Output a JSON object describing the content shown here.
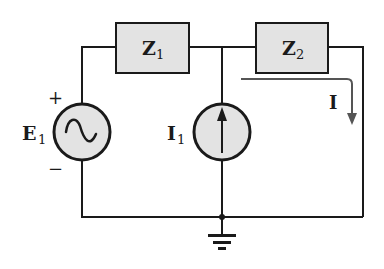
{
  "diagram": {
    "type": "ac circuit schematic",
    "colors": {
      "wire": "#1a1a1a",
      "component_fill": "#e3e3e3",
      "arrow": "#555555",
      "background": "#ffffff"
    },
    "components": {
      "z1": {
        "label": "Z",
        "subscript": "1"
      },
      "z2": {
        "label": "Z",
        "subscript": "2"
      },
      "e1": {
        "label": "E",
        "subscript": "1",
        "plus": "+",
        "minus": "−"
      },
      "i1": {
        "label": "I",
        "subscript": "1"
      },
      "current": {
        "label": "I"
      }
    }
  }
}
